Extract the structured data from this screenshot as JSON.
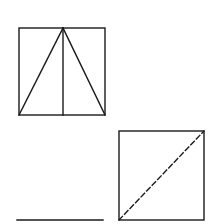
{
  "diagram": {
    "colors": {
      "line": "#1a1a1a",
      "background": "#ffffff"
    },
    "figures": [
      {
        "id": "square-with-triangle",
        "elements": [
          "square-outline",
          "triangle-left-side",
          "triangle-right-side",
          "vertical-median"
        ]
      },
      {
        "id": "square-with-dashed-diagonal",
        "elements": [
          "square-outline",
          "dashed-diagonal"
        ]
      },
      {
        "id": "horizontal-segment",
        "elements": [
          "line"
        ]
      }
    ]
  }
}
